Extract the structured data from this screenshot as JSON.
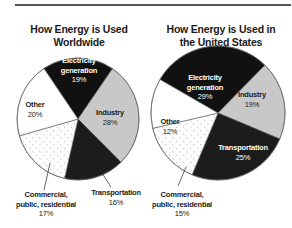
{
  "chart_data": [
    {
      "type": "pie",
      "title": "How Energy is Used Worldwide",
      "categories": [
        "Electricity generation",
        "Industry",
        "Transportation",
        "Commercial, public, residential",
        "Other"
      ],
      "values": [
        19,
        28,
        16,
        17,
        20
      ],
      "unit": "%",
      "fills": [
        "#111111",
        "#c8c8c8",
        "#1c1c1c",
        "dotted-white",
        "#ffffff"
      ],
      "labels": {
        "electricity": {
          "name_line1": "Electricity",
          "name_line2": "generation",
          "pct": "19%"
        },
        "industry": {
          "name": "Industry",
          "pct": "28%"
        },
        "transportation": {
          "name": "Transportation",
          "pct": "16%"
        },
        "commercial": {
          "name_line1": "Commercial,",
          "name_line2": "public, residential",
          "pct": "17%"
        },
        "other": {
          "name": "Other",
          "pct": "20%"
        }
      }
    },
    {
      "type": "pie",
      "title": "How Energy is Used in the United States",
      "categories": [
        "Electricity generation",
        "Industry",
        "Transportation",
        "Commercial, public, residential",
        "Other"
      ],
      "values": [
        29,
        19,
        25,
        15,
        12
      ],
      "unit": "%",
      "fills": [
        "#111111",
        "#c8c8c8",
        "#1c1c1c",
        "dotted-white",
        "#ffffff"
      ],
      "labels": {
        "electricity": {
          "name_line1": "Electricity",
          "name_line2": "generation",
          "pct": "29%"
        },
        "industry": {
          "name": "Industry",
          "pct": "19%"
        },
        "transportation": {
          "name": "Transportation",
          "pct": "25%"
        },
        "commercial": {
          "name_line1": "Commercial,",
          "name_line2": "public, residential",
          "pct": "15%"
        },
        "other": {
          "name": "Other",
          "pct": "12%"
        }
      }
    }
  ],
  "titles": {
    "left_line1": "How Energy is Used",
    "left_line2": "Worldwide",
    "right_line1": "How Energy is Used in",
    "right_line2": "the United States"
  }
}
